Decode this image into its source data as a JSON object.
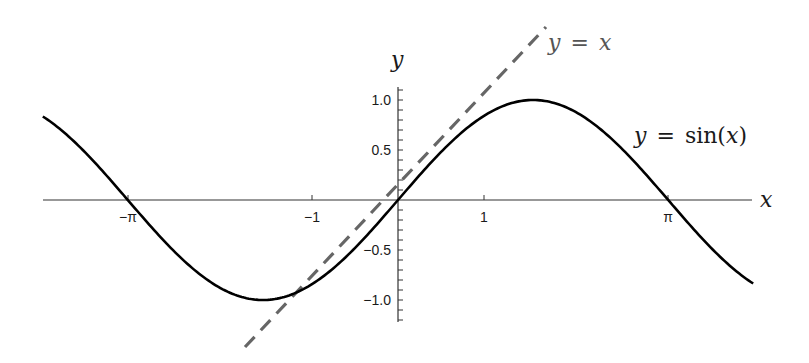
{
  "chart_data": {
    "type": "line",
    "title": "",
    "xlabel": "x",
    "ylabel": "y",
    "xlim": [
      -4.13,
      4.13
    ],
    "ylim": [
      -1.22,
      1.1
    ],
    "grid": false,
    "legend": "inline annotations",
    "x_ticks": [
      {
        "value": -3.14159,
        "label": "−π"
      },
      {
        "value": -1,
        "label": "−1"
      },
      {
        "value": 1,
        "label": "1"
      },
      {
        "value": 3.14159,
        "label": "π"
      }
    ],
    "y_ticks": [
      {
        "value": 1.0,
        "label": "1.0"
      },
      {
        "value": 0.5,
        "label": "0.5"
      },
      {
        "value": -0.5,
        "label": "−0.5"
      },
      {
        "value": -1.0,
        "label": "−1.0"
      }
    ],
    "y_minor_tick_step": 0.1,
    "series": [
      {
        "name": "y = sin(x)",
        "style": "solid",
        "color": "#000000",
        "function": "sin(x)",
        "x_range": [
          -4.13,
          4.13
        ]
      },
      {
        "name": "y = x",
        "style": "dashed",
        "color": "#666666",
        "function": "x",
        "x_range": [
          -1.78,
          1.72
        ]
      }
    ],
    "annotations": [
      {
        "text": "y = x",
        "x": 1.72,
        "y": 1.65,
        "color": "#555555"
      },
      {
        "text": "y = sin(x)",
        "x": 2.75,
        "y": 0.65,
        "color": "#1a1a1a"
      }
    ]
  },
  "labels": {
    "x_axis": "x",
    "y_axis": "y",
    "line_label": "y = x",
    "sine_label_y": "y",
    "sine_label_eq": "=",
    "sine_label_fn": "sin(",
    "sine_label_x": "x",
    "sine_label_close": ")",
    "line_label_y": "y",
    "line_label_eq": "=",
    "line_label_x": "x",
    "tick_neg_pi": "−π",
    "tick_neg_one": "−1",
    "tick_one": "1",
    "tick_pi": "π",
    "tick_y_1": "1.0",
    "tick_y_05": "0.5",
    "tick_y_n05": "−0.5",
    "tick_y_n1": "−1.0"
  },
  "colors": {
    "sine": "#000000",
    "identity_line": "#666666",
    "axis": "#333333"
  }
}
